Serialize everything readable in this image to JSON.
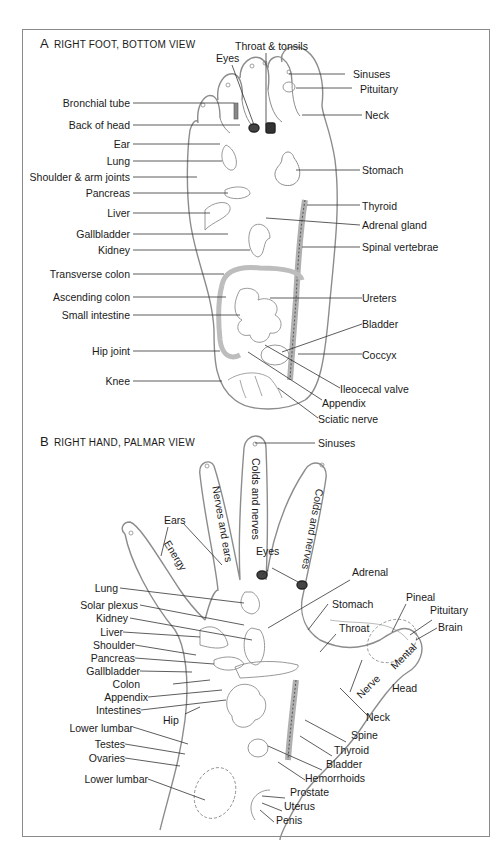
{
  "panel_a": {
    "letter": "A",
    "title": "RIGHT FOOT, BOTTOM VIEW",
    "labels": {
      "throat_tonsils": "Throat & tonsils",
      "eyes": "Eyes",
      "sinuses": "Sinuses",
      "pituitary": "Pituitary",
      "neck": "Neck",
      "bronchial_tube": "Bronchial tube",
      "back_of_head": "Back of head",
      "ear": "Ear",
      "lung": "Lung",
      "shoulder_arm": "Shoulder & arm joints",
      "pancreas": "Pancreas",
      "liver": "Liver",
      "gallbladder": "Gallbladder",
      "kidney": "Kidney",
      "stomach": "Stomach",
      "thyroid": "Thyroid",
      "adrenal_gland": "Adrenal gland",
      "spinal_vertebrae": "Spinal vertebrae",
      "transverse_colon": "Transverse colon",
      "ascending_colon": "Ascending colon",
      "small_intestine": "Small intestine",
      "ureters": "Ureters",
      "bladder": "Bladder",
      "hip_joint": "Hip joint",
      "coccyx": "Coccyx",
      "knee": "Knee",
      "ileocecal_valve": "Ileocecal valve",
      "appendix": "Appendix",
      "sciatic_nerve": "Sciatic nerve"
    }
  },
  "panel_b": {
    "letter": "B",
    "title": "RIGHT HAND, PALMAR VIEW",
    "finger_labels": {
      "pinky": "Energy",
      "ring": "Nerves and ears",
      "middle": "Colds and nerves",
      "index": "Colds and nerves",
      "thumb_mental": "Mental",
      "thumb_nerve": "Nerve"
    },
    "labels": {
      "sinuses": "Sinuses",
      "ears": "Ears",
      "eyes": "Eyes",
      "adrenal": "Adrenal",
      "lung": "Lung",
      "solar_plexus": "Solar plexus",
      "kidney": "Kidney",
      "liver": "Liver",
      "shoulder": "Shoulder",
      "pancreas": "Pancreas",
      "gallbladder": "Gallbladder",
      "colon": "Colon",
      "appendix": "Appendix",
      "intestines": "Intestines",
      "hip": "Hip",
      "lower_lumbar_1": "Lower lumbar",
      "testes": "Testes",
      "ovaries": "Ovaries",
      "lower_lumbar_2": "Lower lumbar",
      "stomach": "Stomach",
      "throat": "Throat",
      "pineal": "Pineal",
      "pituitary": "Pituitary",
      "brain": "Brain",
      "head": "Head",
      "neck": "Neck",
      "spine": "Spine",
      "thyroid": "Thyroid",
      "bladder": "Bladder",
      "hemorrhoids": "Hemorrhoids",
      "prostate": "Prostate",
      "uterus": "Uterus",
      "penis": "Penis"
    }
  }
}
